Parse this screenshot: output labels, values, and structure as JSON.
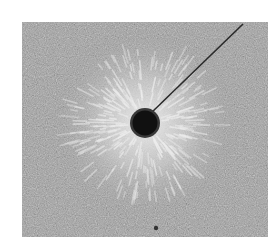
{
  "image": {
    "subject": "iron filings around a current-carrying wire",
    "description": "Grayscale photograph of iron filings forming radial pattern around a dark circular wire cross-section, with a thin wire lead extending to the upper right",
    "colors": {
      "background": "#ffffff",
      "filings_base": "#9c9c9c",
      "filings_light": "#e6e6e6",
      "wire": "#121212",
      "lead": "#2a2a2a"
    }
  }
}
